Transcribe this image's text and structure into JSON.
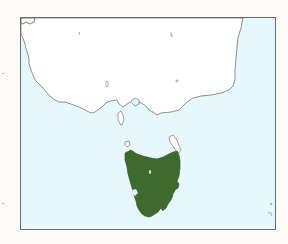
{
  "map": {
    "region": "Southeastern Australia and Tasmania",
    "highlighted_region": "Tasmania",
    "colors": {
      "ocean": "#e6f8fb",
      "land": "#ffffff",
      "highlight": "#3f6a2e",
      "coastline": "#666666",
      "frame": "#6b6b6b",
      "background": "#fdfcf8"
    }
  }
}
